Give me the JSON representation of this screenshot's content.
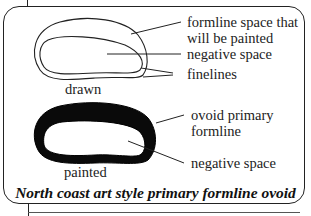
{
  "diagram": {
    "drawn": {
      "title": "drawn",
      "labels": {
        "formline_space": [
          "formline space that",
          "will be painted"
        ],
        "negative_space": "negative space",
        "finelines": "finelines"
      }
    },
    "painted": {
      "title": "painted",
      "labels": {
        "primary_formline": [
          "ovoid primary",
          "formline"
        ],
        "negative_space": "negative space"
      }
    },
    "caption": "North coast art style primary formline ovoid"
  }
}
